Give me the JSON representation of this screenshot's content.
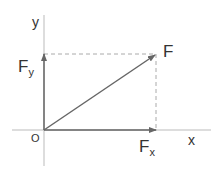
{
  "diagram": {
    "axes": {
      "x_label": "x",
      "y_label": "y",
      "origin_label": "O"
    },
    "vectors": {
      "F": {
        "label": "F"
      },
      "Fx": {
        "label": "F",
        "sub": "x"
      },
      "Fy": {
        "label": "F",
        "sub": "y"
      }
    },
    "colors": {
      "axis": "#bbbbbb",
      "vector": "#666666",
      "dashed": "#aaaaaa",
      "text": "#333333"
    }
  }
}
